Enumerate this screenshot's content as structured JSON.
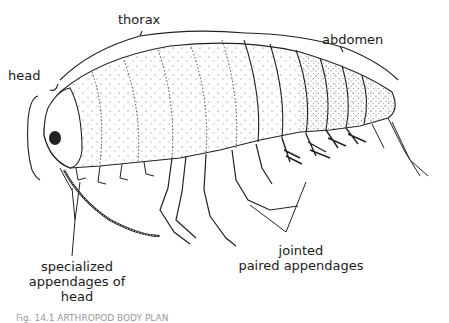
{
  "figure": {
    "labels": {
      "head": "head",
      "thorax": "thorax",
      "abdomen": "abdomen",
      "specialized_line1": "specialized",
      "specialized_line2": "appendages of",
      "specialized_line3": "head",
      "jointed_line1": "jointed",
      "jointed_line2": "paired appendages"
    },
    "caption": "Fig. 14.1  ARTHROPOD BODY PLAN"
  }
}
